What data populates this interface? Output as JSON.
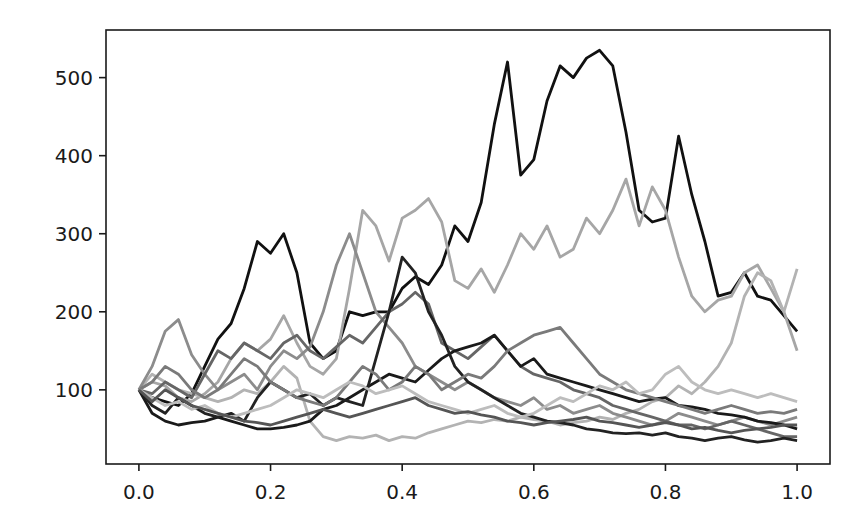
{
  "chart_data": {
    "type": "line",
    "title": "",
    "xlabel": "",
    "ylabel": "",
    "xlim": [
      -0.05,
      1.05
    ],
    "ylim": [
      5,
      561
    ],
    "grid": false,
    "legend": null,
    "xticks": [
      "0.0",
      "0.2",
      "0.4",
      "0.6",
      "0.8",
      "1.0"
    ],
    "yticks": [
      "100",
      "200",
      "300",
      "400",
      "500"
    ],
    "x": [
      0.0,
      0.02,
      0.04,
      0.06,
      0.08,
      0.1,
      0.12,
      0.14,
      0.16,
      0.18,
      0.2,
      0.22,
      0.24,
      0.26,
      0.28,
      0.3,
      0.32,
      0.34,
      0.36,
      0.38,
      0.4,
      0.42,
      0.44,
      0.46,
      0.48,
      0.5,
      0.52,
      0.54,
      0.56,
      0.58,
      0.6,
      0.62,
      0.64,
      0.66,
      0.68,
      0.7,
      0.72,
      0.74,
      0.76,
      0.78,
      0.8,
      0.82,
      0.84,
      0.86,
      0.88,
      0.9,
      0.92,
      0.94,
      0.96,
      0.98,
      1.0
    ],
    "series": [
      {
        "name": "path-1",
        "color": "#111111",
        "values": [
          100,
          90,
          85,
          80,
          95,
          130,
          165,
          185,
          230,
          290,
          275,
          300,
          250,
          160,
          140,
          150,
          200,
          195,
          200,
          200,
          230,
          245,
          235,
          260,
          310,
          290,
          340,
          440,
          520,
          375,
          395,
          470,
          515,
          500,
          525,
          535,
          515,
          430,
          330,
          315,
          320,
          425,
          350,
          290,
          220,
          225,
          250,
          220,
          215,
          195,
          175
        ]
      },
      {
        "name": "path-2",
        "color": "#a6a6a6",
        "values": [
          100,
          110,
          105,
          90,
          85,
          95,
          110,
          140,
          160,
          150,
          165,
          195,
          160,
          130,
          120,
          140,
          230,
          330,
          310,
          265,
          320,
          330,
          345,
          315,
          240,
          230,
          255,
          225,
          260,
          300,
          280,
          310,
          270,
          280,
          320,
          300,
          330,
          370,
          310,
          360,
          330,
          270,
          220,
          200,
          215,
          220,
          250,
          260,
          230,
          200,
          150
        ]
      },
      {
        "name": "path-3",
        "color": "#b3b3b3",
        "values": [
          100,
          120,
          110,
          100,
          95,
          90,
          85,
          90,
          100,
          95,
          110,
          130,
          115,
          60,
          40,
          35,
          40,
          38,
          42,
          35,
          40,
          38,
          45,
          50,
          55,
          60,
          58,
          62,
          60,
          65,
          62,
          60,
          55,
          58,
          60,
          65,
          62,
          70,
          75,
          85,
          90,
          105,
          95,
          110,
          130,
          160,
          220,
          250,
          240,
          200,
          255
        ]
      },
      {
        "name": "path-4",
        "color": "#8c8c8c",
        "values": [
          100,
          130,
          175,
          190,
          145,
          120,
          100,
          110,
          120,
          100,
          130,
          150,
          140,
          155,
          200,
          260,
          300,
          250,
          200,
          180,
          160,
          130,
          120,
          110,
          100,
          110,
          100,
          90,
          85,
          80,
          90,
          75,
          80,
          70,
          75,
          80,
          70,
          65,
          60,
          55,
          60,
          70,
          65,
          60,
          55,
          60,
          65,
          60,
          55,
          60,
          65
        ]
      },
      {
        "name": "path-5",
        "color": "#666666",
        "values": [
          100,
          95,
          110,
          100,
          90,
          120,
          150,
          140,
          160,
          150,
          140,
          160,
          170,
          150,
          140,
          155,
          170,
          160,
          180,
          200,
          210,
          225,
          210,
          160,
          150,
          140,
          155,
          170,
          150,
          130,
          120,
          115,
          110,
          100,
          95,
          90,
          80,
          75,
          70,
          65,
          60,
          55,
          55,
          50,
          55,
          60,
          55,
          50,
          45,
          40,
          40
        ]
      },
      {
        "name": "path-6",
        "color": "#1a1a1a",
        "values": [
          100,
          70,
          60,
          55,
          58,
          60,
          65,
          60,
          55,
          50,
          50,
          52,
          55,
          60,
          75,
          80,
          90,
          100,
          110,
          120,
          115,
          110,
          125,
          140,
          150,
          155,
          160,
          170,
          150,
          130,
          140,
          120,
          115,
          110,
          105,
          100,
          95,
          90,
          85,
          88,
          90,
          80,
          78,
          75,
          70,
          68,
          65,
          60,
          58,
          55,
          50
        ]
      },
      {
        "name": "path-7",
        "color": "#222222",
        "values": [
          100,
          80,
          70,
          90,
          80,
          70,
          65,
          70,
          60,
          90,
          110,
          100,
          90,
          95,
          80,
          90,
          85,
          80,
          140,
          200,
          270,
          250,
          200,
          170,
          130,
          110,
          100,
          90,
          80,
          70,
          65,
          60,
          58,
          55,
          50,
          48,
          45,
          44,
          45,
          42,
          45,
          40,
          38,
          35,
          38,
          40,
          36,
          33,
          35,
          38,
          35
        ]
      },
      {
        "name": "path-8",
        "color": "#7a7a7a",
        "values": [
          100,
          110,
          130,
          120,
          100,
          90,
          100,
          120,
          140,
          130,
          110,
          100,
          90,
          85,
          80,
          90,
          110,
          130,
          120,
          100,
          110,
          130,
          120,
          100,
          110,
          120,
          115,
          130,
          150,
          160,
          170,
          175,
          180,
          160,
          140,
          120,
          110,
          100,
          95,
          90,
          85,
          80,
          75,
          70,
          75,
          80,
          75,
          70,
          72,
          70,
          75
        ]
      },
      {
        "name": "path-9",
        "color": "#bdbdbd",
        "values": [
          100,
          90,
          80,
          85,
          75,
          80,
          70,
          65,
          70,
          75,
          80,
          90,
          100,
          95,
          90,
          100,
          110,
          105,
          95,
          100,
          105,
          95,
          85,
          80,
          75,
          70,
          75,
          80,
          70,
          65,
          70,
          80,
          90,
          85,
          95,
          105,
          100,
          110,
          95,
          100,
          120,
          130,
          110,
          100,
          95,
          100,
          95,
          90,
          95,
          90,
          85
        ]
      },
      {
        "name": "path-10",
        "color": "#555555",
        "values": [
          100,
          85,
          100,
          90,
          80,
          75,
          70,
          65,
          60,
          58,
          55,
          60,
          65,
          70,
          75,
          70,
          65,
          70,
          75,
          80,
          85,
          90,
          80,
          75,
          70,
          72,
          68,
          65,
          60,
          58,
          55,
          58,
          60,
          62,
          65,
          60,
          58,
          55,
          52,
          55,
          58,
          55,
          50,
          52,
          48,
          45,
          48,
          50,
          52,
          55,
          55
        ]
      }
    ]
  },
  "axes": {
    "frame": {
      "left": 106,
      "top": 30,
      "right": 830,
      "bottom": 464
    },
    "x_ticks": [
      {
        "value": 0.0,
        "label": "0.0"
      },
      {
        "value": 0.2,
        "label": "0.2"
      },
      {
        "value": 0.4,
        "label": "0.4"
      },
      {
        "value": 0.6,
        "label": "0.6"
      },
      {
        "value": 0.8,
        "label": "0.8"
      },
      {
        "value": 1.0,
        "label": "1.0"
      }
    ],
    "y_ticks": [
      {
        "value": 100,
        "label": "100"
      },
      {
        "value": 200,
        "label": "200"
      },
      {
        "value": 300,
        "label": "300"
      },
      {
        "value": 400,
        "label": "400"
      },
      {
        "value": 500,
        "label": "500"
      }
    ]
  }
}
